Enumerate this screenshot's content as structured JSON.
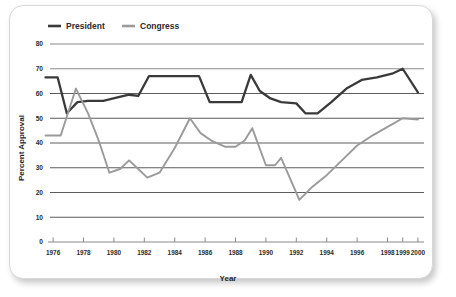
{
  "card": {
    "background": "#ffffff",
    "border_color": "#d8d8d8"
  },
  "chart_data": {
    "type": "line",
    "title": "",
    "xlabel": "Year",
    "ylabel": "Percent Approval",
    "ylim": [
      0,
      80
    ],
    "xlim": [
      1975.4,
      2000.4
    ],
    "grid": true,
    "legend_position": "top-left",
    "y_ticks": [
      "0",
      "10",
      "20",
      "30",
      "40",
      "50",
      "60",
      "70",
      "80"
    ],
    "y_tick_values": [
      0,
      10,
      20,
      30,
      40,
      50,
      60,
      70,
      80
    ],
    "x_ticks": [
      "1976",
      "1978",
      "1980",
      "1982",
      "1984",
      "1986",
      "1988",
      "1990",
      "1992",
      "1994",
      "1996",
      "1998",
      "1999",
      "2000"
    ],
    "x_tick_values": [
      1976,
      1978,
      1980,
      1982,
      1984,
      1986,
      1988,
      1990,
      1992,
      1994,
      1996,
      1998,
      1999,
      2000
    ],
    "series": [
      {
        "name": "President",
        "color": "#3a3a3a",
        "x": [
          1975.5,
          1976.3,
          1976.9,
          1977.6,
          1978.3,
          1979.3,
          1980.3,
          1981.0,
          1981.6,
          1982.3,
          1983.0,
          1984.0,
          1985.0,
          1985.6,
          1986.3,
          1987.0,
          1988.0,
          1988.4,
          1989.0,
          1989.6,
          1990.3,
          1991.0,
          1992.0,
          1992.6,
          1993.4,
          1994.3,
          1995.3,
          1996.3,
          1997.3,
          1998.3,
          1999.0,
          2000.0
        ],
        "values": [
          66.5,
          66.5,
          52.0,
          56.5,
          57.0,
          57.0,
          58.5,
          59.5,
          59.0,
          67.0,
          67.0,
          67.0,
          67.0,
          67.0,
          56.5,
          56.5,
          56.5,
          56.5,
          67.5,
          61.0,
          58.0,
          56.5,
          56.0,
          52.0,
          52.0,
          56.5,
          62.0,
          65.5,
          66.5,
          68.0,
          70.0,
          60.5
        ]
      },
      {
        "name": "Congress",
        "color": "#9a9a9a",
        "x": [
          1975.5,
          1976.5,
          1977.5,
          1978.3,
          1979.0,
          1979.7,
          1980.4,
          1981.0,
          1981.6,
          1982.2,
          1983.0,
          1984.0,
          1985.0,
          1985.7,
          1986.4,
          1987.3,
          1988.0,
          1988.6,
          1989.1,
          1990.0,
          1990.6,
          1991.0,
          1992.2,
          1993.0,
          1994.0,
          1995.0,
          1996.0,
          1997.0,
          1998.0,
          1999.0,
          2000.0
        ],
        "values": [
          43.0,
          43.0,
          62.0,
          52.0,
          41.0,
          28.0,
          29.5,
          33.0,
          29.5,
          26.0,
          28.0,
          38.0,
          50.0,
          44.0,
          41.0,
          38.5,
          38.5,
          41.0,
          46.0,
          31.0,
          31.0,
          34.0,
          17.0,
          22.0,
          27.0,
          33.0,
          39.0,
          43.0,
          46.5,
          50.0,
          49.5
        ]
      }
    ]
  },
  "legend": {
    "items": [
      {
        "label": "President",
        "color": "#3a3a3a"
      },
      {
        "label": "Congress",
        "color": "#9a9a9a"
      }
    ]
  }
}
